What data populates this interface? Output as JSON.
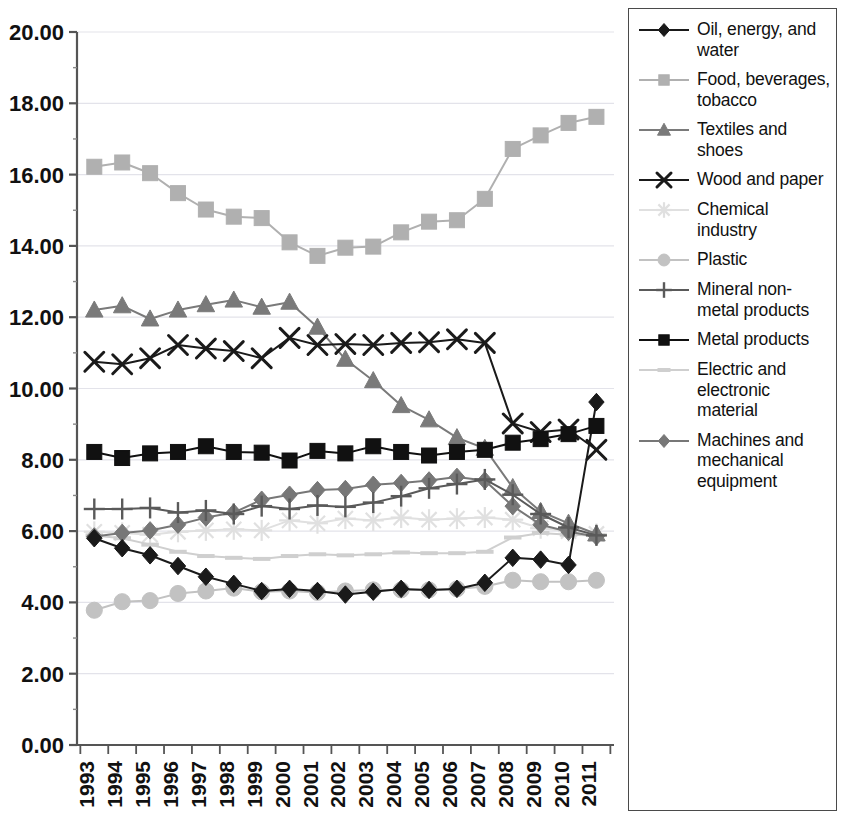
{
  "chart_data": {
    "type": "line",
    "title": "",
    "xlabel": "",
    "ylabel": "",
    "ylim": [
      0,
      20
    ],
    "ytick_step": 2,
    "ytick_labels": [
      "0.00",
      "2.00",
      "4.00",
      "6.00",
      "8.00",
      "10.00",
      "12.00",
      "14.00",
      "16.00",
      "18.00",
      "20.00"
    ],
    "grid": true,
    "legend_position": "right",
    "categories": [
      "1993",
      "1994",
      "1995",
      "1996",
      "1997",
      "1998",
      "1999",
      "2000",
      "2001",
      "2002",
      "2003",
      "2004",
      "2005",
      "2006",
      "2007",
      "2008",
      "2009",
      "2010",
      "2011"
    ],
    "series": [
      {
        "name": "Oil, energy, and water",
        "marker": "diamond",
        "color": "#1a1a1a",
        "values": [
          5.8,
          5.52,
          5.32,
          5.02,
          4.72,
          4.52,
          4.32,
          4.38,
          4.32,
          4.22,
          4.3,
          4.38,
          4.35,
          4.38,
          4.55,
          5.25,
          5.2,
          5.05,
          9.62
        ]
      },
      {
        "name": "Food, beverages, tobacco",
        "marker": "square",
        "color": "#b0b0b0",
        "values": [
          16.22,
          16.34,
          16.04,
          15.48,
          15.02,
          14.82,
          14.78,
          14.1,
          13.72,
          13.95,
          13.98,
          14.38,
          14.68,
          14.72,
          15.32,
          16.72,
          17.1,
          17.45,
          17.62
        ]
      },
      {
        "name": "Textiles and shoes",
        "marker": "triangle",
        "color": "#7a7a7a",
        "values": [
          12.2,
          12.32,
          11.95,
          12.2,
          12.35,
          12.48,
          12.28,
          12.42,
          11.72,
          10.82,
          10.22,
          9.52,
          9.12,
          8.62,
          8.32,
          7.22,
          6.55,
          6.22,
          5.92
        ]
      },
      {
        "name": "Wood and paper",
        "marker": "cross",
        "color": "#1a1a1a",
        "values": [
          10.75,
          10.68,
          10.85,
          11.22,
          11.12,
          11.05,
          10.85,
          11.42,
          11.22,
          11.25,
          11.22,
          11.28,
          11.3,
          11.38,
          11.28,
          9.02,
          8.78,
          8.85,
          8.28
        ]
      },
      {
        "name": "Chemical industry",
        "marker": "star",
        "color": "#e0e0e0",
        "values": [
          5.98,
          5.95,
          5.9,
          5.98,
          6.02,
          6.05,
          6.02,
          6.3,
          6.22,
          6.35,
          6.3,
          6.38,
          6.32,
          6.35,
          6.38,
          6.32,
          6.08,
          6.0,
          5.92
        ]
      },
      {
        "name": "Plastic",
        "marker": "circle",
        "color": "#c2c2c2",
        "values": [
          3.78,
          4.02,
          4.05,
          4.25,
          4.32,
          4.4,
          4.3,
          4.32,
          4.28,
          4.32,
          4.35,
          4.35,
          4.35,
          4.38,
          4.45,
          4.62,
          4.58,
          4.58,
          4.62
        ]
      },
      {
        "name": "Mineral non-metal products",
        "marker": "plus",
        "color": "#5a5a5a",
        "values": [
          6.62,
          6.62,
          6.65,
          6.52,
          6.58,
          6.48,
          6.7,
          6.62,
          6.72,
          6.68,
          6.8,
          6.98,
          7.2,
          7.32,
          7.45,
          7.02,
          6.48,
          6.1,
          5.88
        ]
      },
      {
        "name": "Metal products",
        "marker": "square",
        "color": "#111111",
        "values": [
          8.22,
          8.05,
          8.18,
          8.22,
          8.38,
          8.22,
          8.2,
          7.98,
          8.25,
          8.18,
          8.38,
          8.22,
          8.12,
          8.22,
          8.28,
          8.48,
          8.58,
          8.72,
          8.95
        ]
      },
      {
        "name": "Electric and electronic material",
        "marker": "dash",
        "color": "#cfcfcf",
        "values": [
          5.88,
          5.8,
          5.62,
          5.42,
          5.3,
          5.25,
          5.22,
          5.3,
          5.35,
          5.32,
          5.35,
          5.4,
          5.38,
          5.38,
          5.42,
          5.82,
          5.95,
          5.9,
          5.88
        ]
      },
      {
        "name": "Machines and mechanical equipment",
        "marker": "diamond",
        "color": "#777777",
        "values": [
          5.85,
          5.95,
          6.02,
          6.18,
          6.38,
          6.52,
          6.88,
          7.02,
          7.15,
          7.18,
          7.3,
          7.35,
          7.42,
          7.52,
          7.42,
          6.7,
          6.18,
          5.98,
          5.85
        ]
      }
    ]
  },
  "legend": {
    "items": [
      {
        "label": "Oil, energy, and water",
        "marker": "diamond-icon",
        "color": "#1a1a1a"
      },
      {
        "label": "Food, beverages, tobacco",
        "marker": "square-icon",
        "color": "#b0b0b0"
      },
      {
        "label": "Textiles and shoes",
        "marker": "triangle-icon",
        "color": "#7a7a7a"
      },
      {
        "label": "Wood and paper",
        "marker": "cross-icon",
        "color": "#1a1a1a"
      },
      {
        "label": "Chemical industry",
        "marker": "star-icon",
        "color": "#e0e0e0"
      },
      {
        "label": "Plastic",
        "marker": "circle-icon",
        "color": "#c2c2c2"
      },
      {
        "label": "Mineral non-metal products",
        "marker": "plus-icon",
        "color": "#5a5a5a"
      },
      {
        "label": "Metal products",
        "marker": "square-icon",
        "color": "#111111"
      },
      {
        "label": "Electric and electronic material",
        "marker": "dash-icon",
        "color": "#cfcfcf"
      },
      {
        "label": "Machines and mechanical equipment",
        "marker": "diamond-icon",
        "color": "#777777"
      }
    ]
  }
}
